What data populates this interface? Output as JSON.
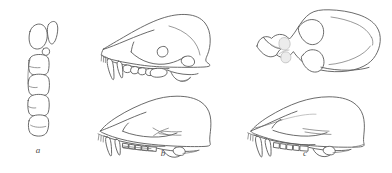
{
  "figure": {
    "kind": "scientific-line-illustration",
    "background_color": "#ffffff",
    "line_color": "#5a5a5a",
    "shade_color": "#ececec",
    "width": 392,
    "height": 173
  },
  "panels": [
    {
      "id": "a",
      "label": "a",
      "label_x": 38,
      "label_y": 150,
      "caption_style": "italic",
      "view": "occlusal tooth row",
      "description": "Vertical column of cheek teeth in crown (occlusal) view with two anterior teeth offset to the upper right"
    },
    {
      "id": "b",
      "label": "b",
      "label_x": 163,
      "label_y": 152,
      "caption_style": "italic",
      "view": "lateral skull views",
      "description": "Two lateral skull outlines, one above the other, showing canines, premolars and molars"
    },
    {
      "id": "c",
      "label": "c",
      "label_x": 303,
      "label_y": 152,
      "caption_style": "italic",
      "view": "dorsal and lateral skull views",
      "description": "Dorsal (top) skull view above a lateral skull view"
    }
  ]
}
